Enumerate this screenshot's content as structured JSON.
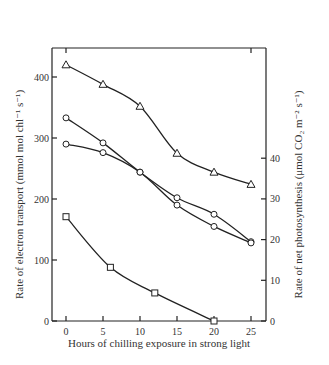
{
  "chart_data": {
    "type": "line",
    "title": "",
    "xlabel": "Hours of chilling exposure in strong light",
    "ylabel_left": "Rate of electron transport (mmol mol chl⁻¹ s⁻¹)",
    "ylabel_right": "Rate of net photosynthesis (μmol CO₂ m⁻² s⁻¹)",
    "x_ticks": [
      "0",
      "5",
      "10",
      "15",
      "20",
      "25"
    ],
    "y_left_ticks": [
      "0",
      "100",
      "200",
      "300",
      "400"
    ],
    "y_right_ticks": [
      "0",
      "10",
      "20",
      "30",
      "40"
    ],
    "xlim": [
      0,
      25
    ],
    "ylim_left": [
      0,
      480
    ],
    "ylim_right": [
      0,
      40
    ],
    "grid": false,
    "series": [
      {
        "name": "triangles",
        "marker": "triangle",
        "x": [
          0,
          5,
          10,
          15,
          20,
          25
        ],
        "values": [
          420,
          388,
          352,
          275,
          244,
          224
        ]
      },
      {
        "name": "circles-upper",
        "marker": "circle",
        "x": [
          0,
          5,
          10,
          15,
          20,
          25
        ],
        "values": [
          333,
          292,
          244,
          202,
          175,
          130
        ]
      },
      {
        "name": "circles-lower",
        "marker": "circle",
        "x": [
          0,
          5,
          10,
          15,
          20,
          25
        ],
        "values": [
          290,
          276,
          244,
          190,
          155,
          128
        ]
      },
      {
        "name": "squares",
        "marker": "square",
        "x": [
          0,
          6,
          12,
          20
        ],
        "values": [
          171,
          88,
          46,
          0
        ]
      }
    ]
  }
}
